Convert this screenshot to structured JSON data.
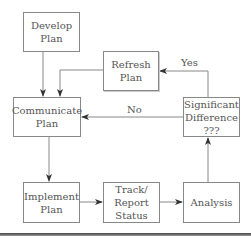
{
  "nodes": {
    "develop": "Develop\nPlan",
    "communicate": "Communicate\nPlan",
    "refresh": "Refresh\nPlan",
    "significant": "Significant\nDifference\n???",
    "implement": "Implement\nPlan",
    "track": "Track/\nReport\nStatus",
    "analysis": "Analysis"
  },
  "edges": {
    "yes_label": "Yes",
    "no_label": "No"
  }
}
